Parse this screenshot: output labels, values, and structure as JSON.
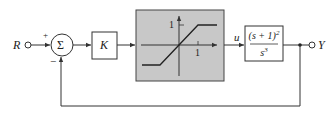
{
  "diagram": {
    "type": "feedback-control-block-diagram",
    "input_label": "R",
    "output_label": "Y",
    "summing_junction": {
      "symbol": "Σ",
      "signs": {
        "reference": "+",
        "feedback": "−"
      }
    },
    "gain_block": {
      "label": "K"
    },
    "nonlinearity": {
      "kind": "saturation",
      "y_tick_label": "1",
      "x_tick_label": "1",
      "fill_color": "#c8c8c8"
    },
    "control_signal_label": "u",
    "plant": {
      "numerator": "(s + 1)",
      "numerator_exponent": "2",
      "denominator": "s",
      "denominator_exponent": "3"
    },
    "feedback": "unity negative feedback"
  }
}
